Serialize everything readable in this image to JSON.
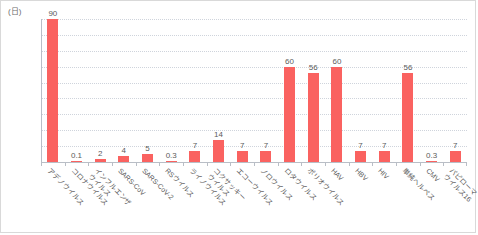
{
  "chart_data": {
    "type": "bar",
    "title": "",
    "subtitle": "",
    "xlabel": "",
    "ylabel": "(日)",
    "unit_label": "(日)",
    "ylim": [
      0,
      90
    ],
    "ytick_step": 10,
    "yticks": [
      0,
      10,
      20,
      30,
      40,
      50,
      60,
      70,
      80,
      90
    ],
    "grid": true,
    "grid_style": "dotted-horizontal",
    "legend": "none",
    "bar_color": "#fa6260",
    "axis_color": "#b9bec6",
    "grid_color": "#cfd4dc",
    "label_color": "#5b5b5b",
    "categories": [
      "アデノウイルス",
      "コロナウイルス",
      "インフルエンザ\nウイルス",
      "SARS-CoV",
      "SARS-CoV-2",
      "RSウイルス",
      "ライノウイルス",
      "コクサッキー\nウイルス",
      "エコーウイルス",
      "ノロウイルス",
      "ロタウイルス",
      "ポリオウイルス",
      "HAV",
      "HBV",
      "HIV",
      "単純ヘルペス",
      "CMV",
      "パピローマ\nウイルス16"
    ],
    "values": [
      90,
      0.1,
      2,
      4,
      5,
      0.3,
      7,
      14,
      7,
      7,
      60,
      56,
      60,
      7,
      7,
      56,
      0.3,
      7
    ],
    "value_labels": [
      "90",
      "0.1",
      "2",
      "4",
      "5",
      "0.3",
      "7",
      "14",
      "7",
      "7",
      "60",
      "56",
      "60",
      "7",
      "7",
      "56",
      "0.3",
      "7"
    ]
  }
}
